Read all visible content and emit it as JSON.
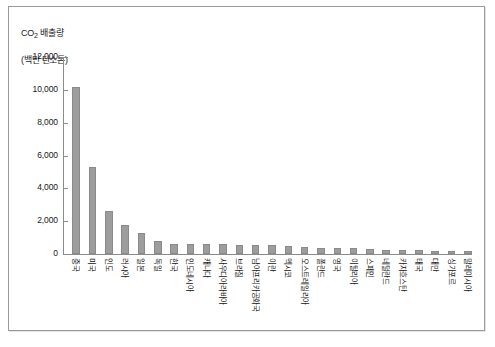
{
  "chart_data": {
    "type": "bar",
    "title": "",
    "ylabel": "CO2 배출량 (백만 탄소톤)",
    "ylabel_line1": "CO",
    "ylabel_sub": "2",
    "ylabel_line1_rest": " 배출량",
    "ylabel_line2": "(백만 탄소톤)",
    "xlabel": "",
    "ylim": [
      0,
      12000
    ],
    "ytick_labels": [
      "12,000",
      "10,000",
      "8,000",
      "6,000",
      "4,000",
      "2,000",
      "0"
    ],
    "ytick_values": [
      12000,
      10000,
      8000,
      6000,
      4000,
      2000,
      0
    ],
    "grid": false,
    "legend": false,
    "bar_color": "#9d9d9d",
    "categories": [
      "중국",
      "미국",
      "인도",
      "러시아",
      "일본",
      "독일",
      "한국",
      "인도네시아",
      "캐나다",
      "사우디아라비아",
      "브라질",
      "남아프리카공화국",
      "이란",
      "멕시코",
      "오스트레일리아",
      "폴란드",
      "영국",
      "이탈리아",
      "스페인",
      "네덜란드",
      "카자흐스탄",
      "태국",
      "대만",
      "싱가포르",
      "말레이시아"
    ],
    "values": [
      10200,
      5300,
      2600,
      1750,
      1250,
      800,
      640,
      620,
      600,
      580,
      560,
      540,
      520,
      480,
      430,
      380,
      360,
      340,
      300,
      270,
      250,
      230,
      210,
      190,
      170
    ]
  }
}
